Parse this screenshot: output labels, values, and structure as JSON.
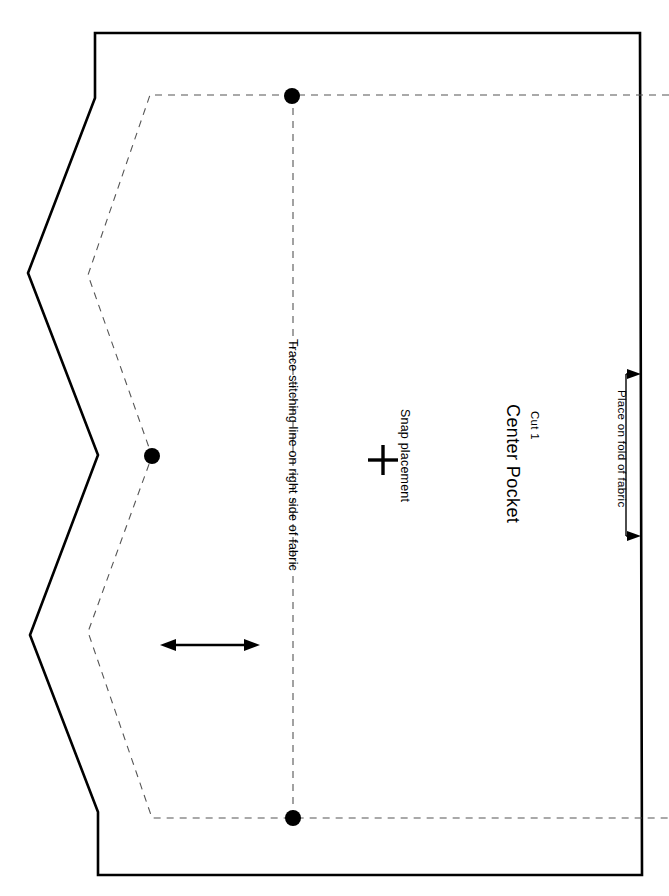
{
  "document": {
    "kind": "sewing-pattern-piece",
    "background_color": "#ffffff",
    "width": 669,
    "height": 896
  },
  "labels": {
    "piece_name": "Center Pocket",
    "cut_quantity": "Cut 1",
    "snap_placement": "Snap placement",
    "trace_stitching": "Trace stitching line on right side of fabric",
    "place_on_fold": "Place on fold of fabric"
  },
  "colors": {
    "cutting_line": "#000000",
    "stitching_line": "#555555",
    "marks": "#000000",
    "paper": "#ffffff"
  },
  "geometry": {
    "cutting_line": {
      "name": "cutting-line",
      "style": "solid",
      "stroke_width": 2.6,
      "points": "95,33 640,33 642,875 98,875 98,812 30,635 98,455 28,273 95,98"
    },
    "stitching_line": {
      "name": "stitching-line",
      "style": "dashed",
      "stroke_width": 1.1,
      "dash": "7 6",
      "points": "669,95 150,95 88,275 152,456 88,632 152,818 669,818"
    },
    "foldline_center": {
      "name": "center-fold-guide",
      "style": "dashed",
      "points": "293,95 293,818"
    },
    "notch_dots": [
      {
        "name": "notch-dot-top",
        "cx": 292,
        "cy": 96,
        "r": 8
      },
      {
        "name": "notch-dot-left",
        "cx": 152,
        "cy": 456,
        "r": 8
      },
      {
        "name": "notch-dot-bottom",
        "cx": 293,
        "cy": 818,
        "r": 8
      }
    ],
    "snap_cross": {
      "name": "snap-cross-mark",
      "cx": 383,
      "cy": 460,
      "arm": 15
    },
    "grainline_arrow": {
      "name": "grainline-arrow",
      "x1": 164,
      "x2": 256,
      "y": 645,
      "direction": "double-headed-horizontal"
    },
    "fold_bracket": {
      "name": "place-on-fold-bracket",
      "edge_x": 640,
      "top_y": 370,
      "bottom_y": 540,
      "stem_x": 626,
      "arrow_direction": "right"
    }
  }
}
